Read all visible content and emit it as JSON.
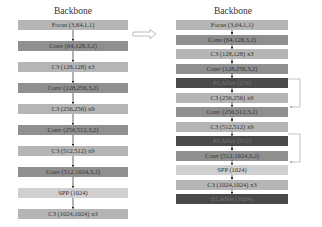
{
  "left": {
    "title": "Backbone",
    "blocks": [
      {
        "label": "Focus (3,64,1,1)",
        "tone": "light"
      },
      {
        "label": "Conv (64,128,3,2)",
        "tone": "mid"
      },
      {
        "label": "C3 (128,128) x3",
        "tone": "light"
      },
      {
        "label": "Conv (128,256,3,2)",
        "tone": "mid"
      },
      {
        "label": "C3 (256,256) x9",
        "tone": "light"
      },
      {
        "label": "Conv (256,512,3,2)",
        "tone": "mid"
      },
      {
        "label": "C3 (512,512) x9",
        "tone": "light"
      },
      {
        "label": "Conv (512,1024,3,2)",
        "tone": "mid"
      },
      {
        "label": "SPP (1024)",
        "tone": "pale"
      },
      {
        "label": "C3 (1024,1024) x3",
        "tone": "light"
      }
    ]
  },
  "right": {
    "title": "Backbone",
    "blocks": [
      {
        "label": "Focus (3,64,1,1)",
        "tone": "light"
      },
      {
        "label": "Conv (64,128,3,2)",
        "tone": "mid"
      },
      {
        "label": "C3 (128,128) x3",
        "tone": "light"
      },
      {
        "label": "Conv (128,256,3,2)",
        "tone": "mid"
      },
      {
        "label": "ECANet (256)",
        "tone": "dark"
      },
      {
        "label": "C3 (256,256) x9",
        "tone": "light"
      },
      {
        "label": "Conv (256,512,3,2)",
        "tone": "mid"
      },
      {
        "label": "C3 (512,512) x9",
        "tone": "light"
      },
      {
        "label": "ECANet (512)",
        "tone": "dark"
      },
      {
        "label": "Conv (512,1024,3,2)",
        "tone": "mid"
      },
      {
        "label": "SPP (1024)",
        "tone": "pale"
      },
      {
        "label": "C3 (1024,1024) x3",
        "tone": "light"
      },
      {
        "label": "ECANet (1024)",
        "tone": "dark"
      }
    ]
  },
  "connector": {
    "icon": "hollow-right-arrow-icon"
  },
  "colors": {
    "light": "#b5b5b5",
    "mid": "#8f8f8f",
    "pale": "#cfcfcf",
    "dark": "#4a4a4a",
    "line": "#aaaaaa"
  }
}
